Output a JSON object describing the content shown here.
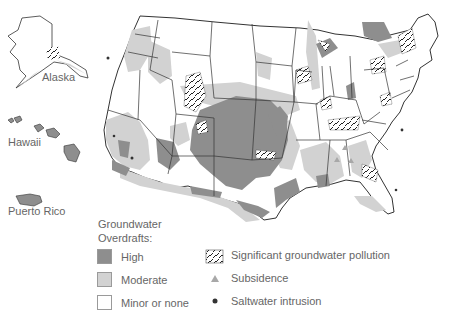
{
  "map": {
    "title": "Groundwater Overdrafts",
    "insets": [
      {
        "name": "Alaska",
        "label": "Alaska"
      },
      {
        "name": "Hawaii",
        "label": "Hawaii"
      },
      {
        "name": "Puerto Rico",
        "label": "Puerto Rico"
      }
    ],
    "colors": {
      "high": "#8e8e8e",
      "moderate": "#d2d2d2",
      "none": "#ffffff",
      "border": "#333333",
      "subsidence": "#a8a8a8",
      "saltwater": "#333333"
    }
  },
  "legend": {
    "title_line1": "Groundwater",
    "title_line2": "Overdrafts:",
    "categories": [
      {
        "label": "High",
        "color": "#8e8e8e"
      },
      {
        "label": "Moderate",
        "color": "#d2d2d2"
      },
      {
        "label": "Minor or none",
        "color": "#ffffff"
      }
    ],
    "symbols": [
      {
        "label": "Significant groundwater pollution",
        "icon": "hatched-pattern"
      },
      {
        "label": "Subsidence",
        "icon": "triangle"
      },
      {
        "label": "Saltwater intrusion",
        "icon": "dot"
      }
    ]
  }
}
